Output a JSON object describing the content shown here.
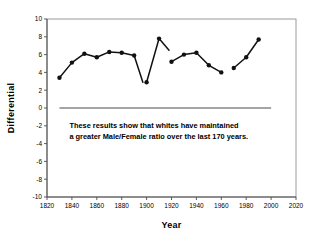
{
  "chart_data": {
    "type": "line",
    "title": "",
    "xlabel": "Year",
    "ylabel": "Differential",
    "xlim": [
      1820,
      2020
    ],
    "ylim": [
      -10,
      10
    ],
    "xticks": [
      1820,
      1840,
      1860,
      1880,
      1900,
      1920,
      1940,
      1960,
      1980,
      2000,
      2020
    ],
    "yticks": [
      10,
      8,
      6,
      4,
      2,
      0,
      -2,
      -4,
      -6,
      -8,
      -10
    ],
    "grid": false,
    "legend": null,
    "reference_line": {
      "y": 0,
      "x_start": 1830,
      "x_end": 2000
    },
    "annotation": {
      "line1": "These results show that whites have maintained",
      "line2": "a greater Male/Female ratio over the last 170 years.",
      "x": 1838,
      "y": -2.2
    },
    "series": [
      {
        "name": "Differential",
        "marker": "circle",
        "color": "#111111",
        "segments": [
          {
            "x": [
              1830,
              1840,
              1850,
              1860,
              1870,
              1880,
              1890,
              1897
            ],
            "y": [
              3.4,
              5.1,
              6.1,
              5.7,
              6.3,
              6.2,
              5.9,
              2.9
            ]
          },
          {
            "x": [
              1900,
              1910,
              1918
            ],
            "y": [
              2.9,
              7.8,
              6.5
            ]
          },
          {
            "x": [
              1920,
              1930,
              1940,
              1950,
              1960
            ],
            "y": [
              5.2,
              6.0,
              6.2,
              4.8,
              4.0
            ]
          },
          {
            "x": [
              1970,
              1980,
              1990
            ],
            "y": [
              4.5,
              5.7,
              7.7
            ]
          }
        ],
        "points": [
          {
            "x": 1830,
            "y": 3.4
          },
          {
            "x": 1840,
            "y": 5.1
          },
          {
            "x": 1850,
            "y": 6.1
          },
          {
            "x": 1860,
            "y": 5.7
          },
          {
            "x": 1870,
            "y": 6.3
          },
          {
            "x": 1880,
            "y": 6.2
          },
          {
            "x": 1890,
            "y": 5.9
          },
          {
            "x": 1900,
            "y": 2.9
          },
          {
            "x": 1910,
            "y": 7.8
          },
          {
            "x": 1920,
            "y": 5.2
          },
          {
            "x": 1930,
            "y": 6.0
          },
          {
            "x": 1940,
            "y": 6.2
          },
          {
            "x": 1950,
            "y": 4.8
          },
          {
            "x": 1960,
            "y": 4.0
          },
          {
            "x": 1970,
            "y": 4.5
          },
          {
            "x": 1980,
            "y": 5.7
          },
          {
            "x": 1990,
            "y": 7.7
          }
        ]
      }
    ]
  }
}
